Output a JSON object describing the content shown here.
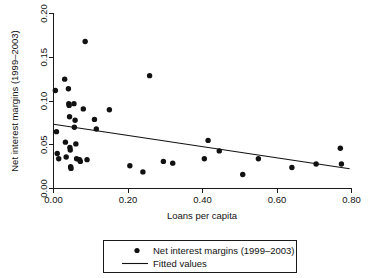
{
  "chart_data": {
    "type": "scatter",
    "title": "",
    "xlabel": "Loans per capita",
    "ylabel": "Net interest margins (1999–2003)",
    "xlim": [
      0.0,
      0.8
    ],
    "ylim": [
      0.0,
      0.2
    ],
    "xticks": [
      "0.00",
      "0.20",
      "0.40",
      "0.60",
      "0.80"
    ],
    "xtick_values": [
      0.0,
      0.2,
      0.4,
      0.6,
      0.8
    ],
    "yticks": [
      "0.00",
      "0.05",
      "0.10",
      "0.15",
      "0.20"
    ],
    "ytick_values": [
      0.0,
      0.05,
      0.1,
      0.15,
      0.2
    ],
    "grid": false,
    "legend_position": "below-center",
    "series": [
      {
        "name": "Net interest margins (1999–2003)",
        "type": "scatter",
        "marker": "filled-circle",
        "color": "#111111",
        "points": [
          [
            0.005,
            0.112
          ],
          [
            0.008,
            0.065
          ],
          [
            0.01,
            0.04
          ],
          [
            0.014,
            0.034
          ],
          [
            0.03,
            0.125
          ],
          [
            0.032,
            0.053
          ],
          [
            0.034,
            0.036
          ],
          [
            0.04,
            0.114
          ],
          [
            0.041,
            0.097
          ],
          [
            0.042,
            0.095
          ],
          [
            0.043,
            0.082
          ],
          [
            0.044,
            0.047
          ],
          [
            0.045,
            0.044
          ],
          [
            0.046,
            0.025
          ],
          [
            0.047,
            0.023
          ],
          [
            0.055,
            0.097
          ],
          [
            0.056,
            0.07
          ],
          [
            0.058,
            0.078
          ],
          [
            0.06,
            0.051
          ],
          [
            0.062,
            0.034
          ],
          [
            0.07,
            0.033
          ],
          [
            0.072,
            0.031
          ],
          [
            0.08,
            0.091
          ],
          [
            0.085,
            0.168
          ],
          [
            0.09,
            0.033
          ],
          [
            0.11,
            0.079
          ],
          [
            0.115,
            0.068
          ],
          [
            0.15,
            0.09
          ],
          [
            0.205,
            0.026
          ],
          [
            0.24,
            0.019
          ],
          [
            0.258,
            0.129
          ],
          [
            0.295,
            0.031
          ],
          [
            0.32,
            0.029
          ],
          [
            0.405,
            0.034
          ],
          [
            0.415,
            0.055
          ],
          [
            0.445,
            0.043
          ],
          [
            0.508,
            0.016
          ],
          [
            0.55,
            0.034
          ],
          [
            0.64,
            0.024
          ],
          [
            0.705,
            0.028
          ],
          [
            0.77,
            0.046
          ],
          [
            0.773,
            0.028
          ]
        ]
      },
      {
        "name": "Fitted values",
        "type": "line",
        "color": "#111111",
        "endpoints": [
          [
            0.0,
            0.0735
          ],
          [
            0.795,
            0.0225
          ]
        ],
        "slope": -0.0641,
        "intercept": 0.0735
      }
    ]
  },
  "legend": {
    "entries": [
      {
        "label": "Net interest margins (1999–2003)",
        "marker": "filled-circle"
      },
      {
        "label": "Fitted values",
        "marker": "line"
      }
    ]
  },
  "axes": {
    "x_title": "Loans per capita",
    "y_title": "Net interest margins (1999–2003)",
    "x_tick_labels": [
      "0.00",
      "0.20",
      "0.40",
      "0.60",
      "0.80"
    ],
    "y_tick_labels": [
      "0.00",
      "0.05",
      "0.10",
      "0.15",
      "0.20"
    ]
  },
  "colors": {
    "marker": "#111111",
    "line": "#111111",
    "axis": "#1a1a1a",
    "background": "#ffffff"
  }
}
